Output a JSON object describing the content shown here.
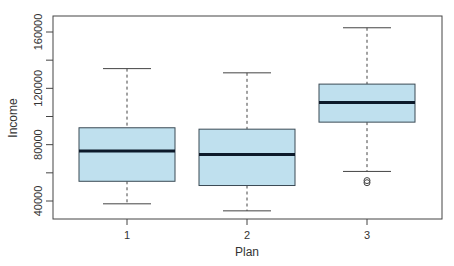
{
  "chart_data": {
    "type": "boxplot",
    "title": "",
    "xlabel": "Plan",
    "ylabel": "Income",
    "categories": [
      "1",
      "2",
      "3"
    ],
    "ylim": [
      30000,
      170000
    ],
    "yticks": [
      40000,
      80000,
      120000,
      160000
    ],
    "ytick_labels": [
      "40000",
      "80000",
      "120000",
      "160000"
    ],
    "yminor_ticks": [
      60000,
      100000,
      140000
    ],
    "grid": false,
    "legend": null,
    "series": [
      {
        "name": "1",
        "whisker_low": 38000,
        "q1": 54000,
        "median": 75500,
        "q3": 92000,
        "whisker_high": 134000,
        "outliers": []
      },
      {
        "name": "2",
        "whisker_low": 33000,
        "q1": 51000,
        "median": 73000,
        "q3": 91000,
        "whisker_high": 131000,
        "outliers": []
      },
      {
        "name": "3",
        "whisker_low": 61000,
        "q1": 96000,
        "median": 110000,
        "q3": 123000,
        "whisker_high": 163000,
        "outliers": [
          53000,
          54500
        ]
      }
    ],
    "colors": {
      "box_fill": "#bfe0ee",
      "box_border": "#3b4a55",
      "median": "#0d1a2a",
      "whisker": "#444444",
      "frame": "#444444"
    }
  }
}
